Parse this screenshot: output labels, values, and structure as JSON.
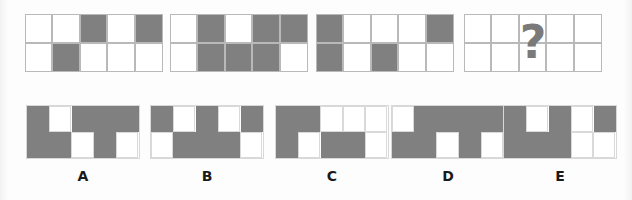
{
  "puzzle": {
    "type": "visual-sequence-matrix-reasoning",
    "grid": {
      "rows": 2,
      "cols": 5
    },
    "colors": {
      "filled": "#808080",
      "empty": "#ffffff",
      "gridline": "#b9b9b9",
      "label": "#1a1a1a",
      "question_mark": "#7a7a7a"
    },
    "question_mark": "?",
    "question_row": {
      "panels": [
        {
          "name": "question-panel-1",
          "index": 1,
          "cells": [
            [
              "white",
              "white",
              "gray",
              "white",
              "gray"
            ],
            [
              "white",
              "gray",
              "white",
              "white",
              "white"
            ]
          ]
        },
        {
          "name": "question-panel-2",
          "index": 2,
          "cells": [
            [
              "white",
              "gray",
              "white",
              "gray",
              "gray"
            ],
            [
              "white",
              "gray",
              "gray",
              "gray",
              "white"
            ]
          ]
        },
        {
          "name": "question-panel-3",
          "index": 3,
          "cells": [
            [
              "gray",
              "white",
              "white",
              "white",
              "gray"
            ],
            [
              "gray",
              "white",
              "gray",
              "white",
              "white"
            ]
          ]
        },
        {
          "name": "question-panel-4-unknown",
          "index": 4,
          "is_unknown": true,
          "cells": [
            [
              "white",
              "white",
              "white",
              "white",
              "white"
            ],
            [
              "white",
              "white",
              "white",
              "white",
              "white"
            ]
          ]
        }
      ]
    },
    "options_row": {
      "options": [
        {
          "name": "option-a",
          "label": "A",
          "cells": [
            [
              "gray",
              "white",
              "gray",
              "gray",
              "gray"
            ],
            [
              "gray",
              "gray",
              "white",
              "gray",
              "white"
            ]
          ]
        },
        {
          "name": "option-b",
          "label": "B",
          "cells": [
            [
              "gray",
              "white",
              "gray",
              "white",
              "gray"
            ],
            [
              "white",
              "gray",
              "gray",
              "gray",
              "white"
            ]
          ]
        },
        {
          "name": "option-c",
          "label": "C",
          "cells": [
            [
              "gray",
              "gray",
              "white",
              "white",
              "white"
            ],
            [
              "gray",
              "white",
              "gray",
              "gray",
              "white"
            ]
          ]
        },
        {
          "name": "option-d",
          "label": "D",
          "cells": [
            [
              "white",
              "gray",
              "gray",
              "gray",
              "gray"
            ],
            [
              "gray",
              "gray",
              "white",
              "gray",
              "white"
            ]
          ]
        },
        {
          "name": "option-e",
          "label": "E",
          "cells": [
            [
              "gray",
              "white",
              "gray",
              "white",
              "gray"
            ],
            [
              "gray",
              "gray",
              "gray",
              "white",
              "white"
            ]
          ]
        }
      ]
    }
  }
}
